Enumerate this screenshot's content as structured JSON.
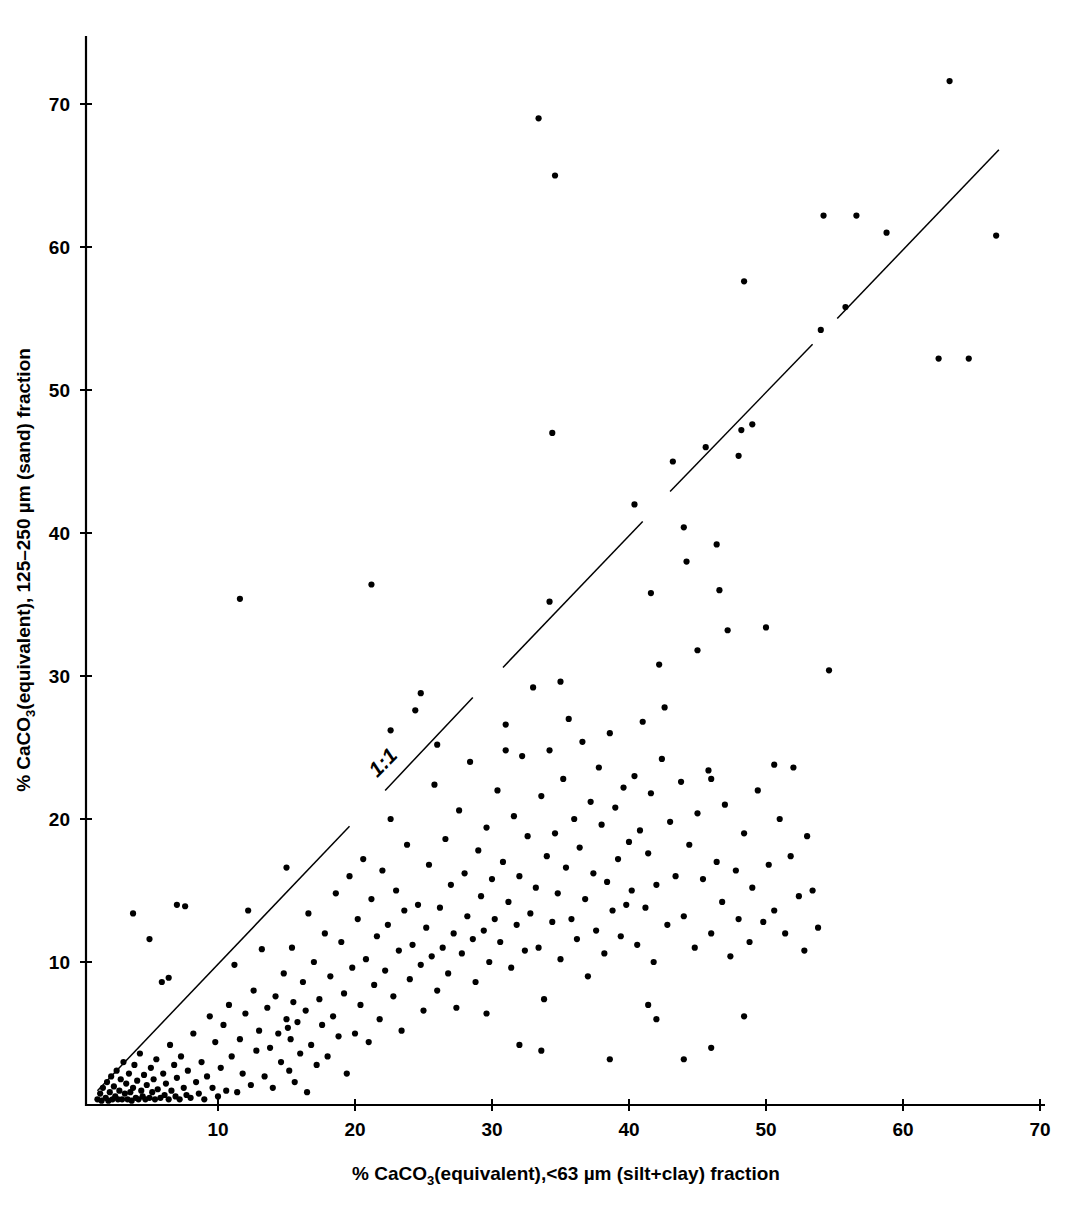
{
  "chart_data": {
    "type": "scatter",
    "title": "",
    "xlabel": "% CaCO3(equivalent),<63 µm (silt+clay) fraction",
    "ylabel": "% CaCO3(equivalent), 125–250 µm (sand) fraction",
    "xlabel_parts": {
      "pre": "% CaCO",
      "sub": "3",
      "post": "(equivalent),<63 µm (silt+clay) fraction"
    },
    "ylabel_parts": {
      "pre": "% CaCO",
      "sub": "3",
      "post": "(equivalent), 125–250 µm (sand) fraction"
    },
    "xlim": [
      0,
      70
    ],
    "ylim": [
      0,
      74
    ],
    "xticks": [
      10,
      20,
      30,
      40,
      50,
      60,
      70
    ],
    "yticks": [
      10,
      20,
      30,
      40,
      50,
      60,
      70
    ],
    "xtick_labels": [
      "10",
      "20",
      "30",
      "40",
      "50",
      "60",
      "70"
    ],
    "ytick_labels": [
      "10",
      "20",
      "30",
      "40",
      "50",
      "60",
      "70"
    ],
    "grid": false,
    "legend": "none",
    "marker": "filled-circle",
    "marker_color": "#000000",
    "marker_size_px": 5,
    "annotations": [
      {
        "text": "1:1",
        "x": 22.4,
        "y": 23.6,
        "rotation_deg": -45,
        "description": "label on the 1:1 reference line"
      }
    ],
    "reference_line": {
      "name": "1:1 line",
      "slope": 1,
      "intercept": 0,
      "style": "solid, broken into segments",
      "segments": [
        {
          "x0": 1.2,
          "y0": 1.0,
          "x1": 19.6,
          "y1": 19.5
        },
        {
          "x0": 22.2,
          "y0": 22.0,
          "x1": 28.6,
          "y1": 28.5
        },
        {
          "x0": 30.8,
          "y0": 30.6,
          "x1": 41.0,
          "y1": 40.8
        },
        {
          "x0": 43.0,
          "y0": 42.9,
          "x1": 53.4,
          "y1": 53.2
        },
        {
          "x0": 55.2,
          "y0": 55.0,
          "x1": 67.0,
          "y1": 66.8
        }
      ]
    },
    "points": [
      [
        1.2,
        0.4
      ],
      [
        1.4,
        0.8
      ],
      [
        1.5,
        0.3
      ],
      [
        1.6,
        1.2
      ],
      [
        1.8,
        0.5
      ],
      [
        1.9,
        1.6
      ],
      [
        2.0,
        0.3
      ],
      [
        2.1,
        0.9
      ],
      [
        2.2,
        2.0
      ],
      [
        2.3,
        0.4
      ],
      [
        2.4,
        1.3
      ],
      [
        2.5,
        0.6
      ],
      [
        2.6,
        2.4
      ],
      [
        2.7,
        0.4
      ],
      [
        2.8,
        1.0
      ],
      [
        2.9,
        1.8
      ],
      [
        3.0,
        0.4
      ],
      [
        3.1,
        3.0
      ],
      [
        3.2,
        0.8
      ],
      [
        3.3,
        1.5
      ],
      [
        3.4,
        0.4
      ],
      [
        3.5,
        2.2
      ],
      [
        3.6,
        0.9
      ],
      [
        3.7,
        0.3
      ],
      [
        3.8,
        1.2
      ],
      [
        3.9,
        2.8
      ],
      [
        4.0,
        0.5
      ],
      [
        4.1,
        1.7
      ],
      [
        4.2,
        0.4
      ],
      [
        4.3,
        3.6
      ],
      [
        4.4,
        1.0
      ],
      [
        4.5,
        0.6
      ],
      [
        4.6,
        2.1
      ],
      [
        4.7,
        0.4
      ],
      [
        4.8,
        1.4
      ],
      [
        5.0,
        0.5
      ],
      [
        5.1,
        2.6
      ],
      [
        5.2,
        0.9
      ],
      [
        5.3,
        1.8
      ],
      [
        5.4,
        0.4
      ],
      [
        5.5,
        3.2
      ],
      [
        5.6,
        1.1
      ],
      [
        5.8,
        0.5
      ],
      [
        5.9,
        8.6
      ],
      [
        6.0,
        2.2
      ],
      [
        6.1,
        0.7
      ],
      [
        6.2,
        1.5
      ],
      [
        6.4,
        0.4
      ],
      [
        6.5,
        4.2
      ],
      [
        6.6,
        1.0
      ],
      [
        6.8,
        2.8
      ],
      [
        6.9,
        0.6
      ],
      [
        7.0,
        1.9
      ],
      [
        7.2,
        0.4
      ],
      [
        7.3,
        3.4
      ],
      [
        7.5,
        1.2
      ],
      [
        7.6,
        13.9
      ],
      [
        7.7,
        0.7
      ],
      [
        7.8,
        2.4
      ],
      [
        8.0,
        0.5
      ],
      [
        8.2,
        5.0
      ],
      [
        8.4,
        1.6
      ],
      [
        8.6,
        0.8
      ],
      [
        8.8,
        3.0
      ],
      [
        9.0,
        0.4
      ],
      [
        9.2,
        2.0
      ],
      [
        9.4,
        6.2
      ],
      [
        9.6,
        1.2
      ],
      [
        9.8,
        4.4
      ],
      [
        10.0,
        0.6
      ],
      [
        3.8,
        13.4
      ],
      [
        5.0,
        11.6
      ],
      [
        6.4,
        8.9
      ],
      [
        7.0,
        14.0
      ],
      [
        10.2,
        2.6
      ],
      [
        10.4,
        5.6
      ],
      [
        10.6,
        1.0
      ],
      [
        10.8,
        7.0
      ],
      [
        11.0,
        3.4
      ],
      [
        11.2,
        9.8
      ],
      [
        11.4,
        0.9
      ],
      [
        11.6,
        4.6
      ],
      [
        11.8,
        2.2
      ],
      [
        12.0,
        6.4
      ],
      [
        12.2,
        13.6
      ],
      [
        12.4,
        1.4
      ],
      [
        12.6,
        8.0
      ],
      [
        12.8,
        3.8
      ],
      [
        13.0,
        5.2
      ],
      [
        13.2,
        10.9
      ],
      [
        13.4,
        2.0
      ],
      [
        13.6,
        6.8
      ],
      [
        13.8,
        4.0
      ],
      [
        14.0,
        1.2
      ],
      [
        14.2,
        7.6
      ],
      [
        14.4,
        5.0
      ],
      [
        14.6,
        3.0
      ],
      [
        14.8,
        9.2
      ],
      [
        15.0,
        6.0
      ],
      [
        15.1,
        5.4
      ],
      [
        15.2,
        2.4
      ],
      [
        15.3,
        4.6
      ],
      [
        15.4,
        11.0
      ],
      [
        15.5,
        7.2
      ],
      [
        15.6,
        1.6
      ],
      [
        15.8,
        5.8
      ],
      [
        16.0,
        3.6
      ],
      [
        16.2,
        8.6
      ],
      [
        16.4,
        6.6
      ],
      [
        16.5,
        0.9
      ],
      [
        16.6,
        13.4
      ],
      [
        16.8,
        4.2
      ],
      [
        17.0,
        10.0
      ],
      [
        17.2,
        2.8
      ],
      [
        17.4,
        7.4
      ],
      [
        17.6,
        5.6
      ],
      [
        17.8,
        12.0
      ],
      [
        18.0,
        3.4
      ],
      [
        18.2,
        9.0
      ],
      [
        18.4,
        6.2
      ],
      [
        18.6,
        14.8
      ],
      [
        18.8,
        4.8
      ],
      [
        19.0,
        11.4
      ],
      [
        19.2,
        7.8
      ],
      [
        19.4,
        2.2
      ],
      [
        19.6,
        16.0
      ],
      [
        19.8,
        9.6
      ],
      [
        20.0,
        5.0
      ],
      [
        11.6,
        35.4
      ],
      [
        15.0,
        16.6
      ],
      [
        20.2,
        13.0
      ],
      [
        20.4,
        7.0
      ],
      [
        20.6,
        17.2
      ],
      [
        20.8,
        10.2
      ],
      [
        21.0,
        4.4
      ],
      [
        21.2,
        14.4
      ],
      [
        21.4,
        8.4
      ],
      [
        21.6,
        11.8
      ],
      [
        21.8,
        6.0
      ],
      [
        22.0,
        16.4
      ],
      [
        22.2,
        9.4
      ],
      [
        22.4,
        12.6
      ],
      [
        22.6,
        20.0
      ],
      [
        22.8,
        7.6
      ],
      [
        23.0,
        15.0
      ],
      [
        23.2,
        10.8
      ],
      [
        23.4,
        5.2
      ],
      [
        23.6,
        13.6
      ],
      [
        23.8,
        18.2
      ],
      [
        24.0,
        8.8
      ],
      [
        24.2,
        11.2
      ],
      [
        24.4,
        27.6
      ],
      [
        24.6,
        14.0
      ],
      [
        24.8,
        9.8
      ],
      [
        25.0,
        6.6
      ],
      [
        25.2,
        12.4
      ],
      [
        25.4,
        16.8
      ],
      [
        25.6,
        10.4
      ],
      [
        25.8,
        22.4
      ],
      [
        26.0,
        8.0
      ],
      [
        26.2,
        13.8
      ],
      [
        26.4,
        11.0
      ],
      [
        26.6,
        18.6
      ],
      [
        26.8,
        9.2
      ],
      [
        27.0,
        15.4
      ],
      [
        27.2,
        12.0
      ],
      [
        27.4,
        6.8
      ],
      [
        27.6,
        20.6
      ],
      [
        27.8,
        10.6
      ],
      [
        28.0,
        16.2
      ],
      [
        28.2,
        13.2
      ],
      [
        28.4,
        24.0
      ],
      [
        28.6,
        11.6
      ],
      [
        28.8,
        8.6
      ],
      [
        29.0,
        17.8
      ],
      [
        29.2,
        14.6
      ],
      [
        29.4,
        12.2
      ],
      [
        29.6,
        19.4
      ],
      [
        29.8,
        10.0
      ],
      [
        30.0,
        15.8
      ],
      [
        22.6,
        26.2
      ],
      [
        24.8,
        28.8
      ],
      [
        26.0,
        25.2
      ],
      [
        21.2,
        36.4
      ],
      [
        30.2,
        13.0
      ],
      [
        30.4,
        22.0
      ],
      [
        30.6,
        11.4
      ],
      [
        30.8,
        17.0
      ],
      [
        31.0,
        26.6
      ],
      [
        31.2,
        14.2
      ],
      [
        31.4,
        9.6
      ],
      [
        31.6,
        20.2
      ],
      [
        31.8,
        12.6
      ],
      [
        32.0,
        16.0
      ],
      [
        32.2,
        24.4
      ],
      [
        32.4,
        10.8
      ],
      [
        32.6,
        18.8
      ],
      [
        32.8,
        13.4
      ],
      [
        33.0,
        29.2
      ],
      [
        33.2,
        15.2
      ],
      [
        33.4,
        11.0
      ],
      [
        33.6,
        21.6
      ],
      [
        33.8,
        7.4
      ],
      [
        34.0,
        17.4
      ],
      [
        34.2,
        24.8
      ],
      [
        34.4,
        12.8
      ],
      [
        34.6,
        19.0
      ],
      [
        34.8,
        14.8
      ],
      [
        35.0,
        10.2
      ],
      [
        35.2,
        22.8
      ],
      [
        35.4,
        16.6
      ],
      [
        35.6,
        27.0
      ],
      [
        35.8,
        13.0
      ],
      [
        36.0,
        20.0
      ],
      [
        36.2,
        11.6
      ],
      [
        36.4,
        18.0
      ],
      [
        36.6,
        25.4
      ],
      [
        36.8,
        14.4
      ],
      [
        37.0,
        9.0
      ],
      [
        37.2,
        21.2
      ],
      [
        37.4,
        16.2
      ],
      [
        37.6,
        12.2
      ],
      [
        37.8,
        23.6
      ],
      [
        38.0,
        19.6
      ],
      [
        38.2,
        10.6
      ],
      [
        38.4,
        15.6
      ],
      [
        38.6,
        26.0
      ],
      [
        38.8,
        13.6
      ],
      [
        39.0,
        20.8
      ],
      [
        39.2,
        17.2
      ],
      [
        39.4,
        11.8
      ],
      [
        39.6,
        22.2
      ],
      [
        39.8,
        14.0
      ],
      [
        40.0,
        18.4
      ],
      [
        33.4,
        69.0
      ],
      [
        34.6,
        65.0
      ],
      [
        34.4,
        47.0
      ],
      [
        34.2,
        35.2
      ],
      [
        35.0,
        29.6
      ],
      [
        31.0,
        24.8
      ],
      [
        29.6,
        6.4
      ],
      [
        33.6,
        3.8
      ],
      [
        32.0,
        4.2
      ],
      [
        40.2,
        15.0
      ],
      [
        40.4,
        23.0
      ],
      [
        40.6,
        11.2
      ],
      [
        40.8,
        19.2
      ],
      [
        41.0,
        26.8
      ],
      [
        41.2,
        13.8
      ],
      [
        41.4,
        17.6
      ],
      [
        41.6,
        21.8
      ],
      [
        41.8,
        10.0
      ],
      [
        42.0,
        15.4
      ],
      [
        42.4,
        24.2
      ],
      [
        42.8,
        12.6
      ],
      [
        43.0,
        19.8
      ],
      [
        43.4,
        16.0
      ],
      [
        43.8,
        22.6
      ],
      [
        44.0,
        13.2
      ],
      [
        44.4,
        18.2
      ],
      [
        44.8,
        11.0
      ],
      [
        45.0,
        20.4
      ],
      [
        45.4,
        15.8
      ],
      [
        45.8,
        23.4
      ],
      [
        46.0,
        12.0
      ],
      [
        46.4,
        17.0
      ],
      [
        46.8,
        14.2
      ],
      [
        47.0,
        21.0
      ],
      [
        47.4,
        10.4
      ],
      [
        47.8,
        16.4
      ],
      [
        48.0,
        13.0
      ],
      [
        48.4,
        19.0
      ],
      [
        48.8,
        11.4
      ],
      [
        49.0,
        15.2
      ],
      [
        49.4,
        22.0
      ],
      [
        49.8,
        12.8
      ],
      [
        40.4,
        42.0
      ],
      [
        41.6,
        35.8
      ],
      [
        42.2,
        30.8
      ],
      [
        42.6,
        27.8
      ],
      [
        43.2,
        45.0
      ],
      [
        44.0,
        40.4
      ],
      [
        44.2,
        38.0
      ],
      [
        45.0,
        31.8
      ],
      [
        45.6,
        46.0
      ],
      [
        46.0,
        22.8
      ],
      [
        46.4,
        39.2
      ],
      [
        46.6,
        36.0
      ],
      [
        47.2,
        33.2
      ],
      [
        48.0,
        45.4
      ],
      [
        48.2,
        47.2
      ],
      [
        48.4,
        57.6
      ],
      [
        49.0,
        47.6
      ],
      [
        46.0,
        4.0
      ],
      [
        44.0,
        3.2
      ],
      [
        48.4,
        6.2
      ],
      [
        42.0,
        6.0
      ],
      [
        38.6,
        3.2
      ],
      [
        41.4,
        7.0
      ],
      [
        50.2,
        16.8
      ],
      [
        50.6,
        13.6
      ],
      [
        51.0,
        20.0
      ],
      [
        51.4,
        12.0
      ],
      [
        51.8,
        17.4
      ],
      [
        52.0,
        23.6
      ],
      [
        52.4,
        14.6
      ],
      [
        52.8,
        10.8
      ],
      [
        53.0,
        18.8
      ],
      [
        53.4,
        15.0
      ],
      [
        53.8,
        12.4
      ],
      [
        54.0,
        54.2
      ],
      [
        54.2,
        62.2
      ],
      [
        54.6,
        30.4
      ],
      [
        55.8,
        55.8
      ],
      [
        56.6,
        62.2
      ],
      [
        58.8,
        61.0
      ],
      [
        62.6,
        52.2
      ],
      [
        63.4,
        71.6
      ],
      [
        64.8,
        52.2
      ],
      [
        66.8,
        60.8
      ],
      [
        50.0,
        33.4
      ],
      [
        50.6,
        23.8
      ]
    ]
  }
}
